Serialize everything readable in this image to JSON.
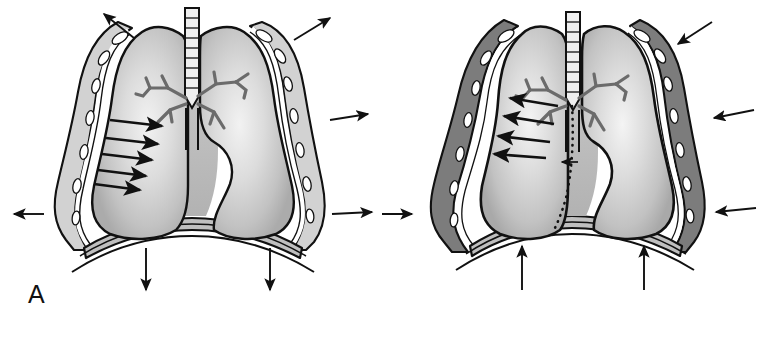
{
  "figure": {
    "style": "grayscale halftone medical line drawing",
    "colors": {
      "outline": "#111111",
      "lung_fill_light": "#e8e8e8",
      "lung_fill_mid": "#c9c9c9",
      "lung_fill_dark": "#b0b0b0",
      "chest_wall_fill": "#d0d0d0",
      "pleural_space_dark": "#7a7a7a",
      "rib_fill": "#ffffff",
      "background": "#ffffff",
      "arrow": "#111111",
      "bronchus": "#6b6b6b"
    }
  },
  "panels": [
    {
      "id": "A",
      "label": "A",
      "name": "panel-a-normal-recoil",
      "description": "Normal thorax: chest wall recoils outward, lungs recoil inward, diaphragm descends",
      "structures": [
        {
          "name": "trachea",
          "detail": "midline airway with cartilage rings"
        },
        {
          "name": "right-lung",
          "detail": "shaded lung field, left of midline in image"
        },
        {
          "name": "left-lung",
          "detail": "shaded lung field, right of midline in image"
        },
        {
          "name": "bronchial-tree",
          "detail": "branching main and lobar bronchi"
        },
        {
          "name": "chest-wall",
          "detail": "ribs shown as white oval cross-sections"
        },
        {
          "name": "diaphragm",
          "detail": "dome-shaped muscle at thorax base"
        },
        {
          "name": "pleural-layers",
          "detail": "thin visceral and parietal pleura, apposed"
        }
      ],
      "arrows": {
        "chest_wall_outward": {
          "count": 4,
          "direction": "outward",
          "meaning": "chest wall elastic recoil outward"
        },
        "lung_inward": {
          "count": 5,
          "direction": "inward",
          "meaning": "lung elastic recoil inward"
        },
        "diaphragm": {
          "count": 2,
          "direction": "down",
          "meaning": "diaphragm descends"
        }
      },
      "mediastinal_shift": false
    },
    {
      "id": "B",
      "label": "B",
      "name": "panel-b-collapse-pneumothorax",
      "description": "Pleural space filled: lung collapses inward, chest wall moves inward, diaphragm elevates, mediastinum shifts",
      "structures": [
        {
          "name": "trachea",
          "detail": "midline airway with cartilage rings"
        },
        {
          "name": "collapsed-right-lung",
          "detail": "lung retracted from chest wall"
        },
        {
          "name": "left-lung",
          "detail": "shaded lung field"
        },
        {
          "name": "bronchial-tree",
          "detail": "branching main and lobar bronchi"
        },
        {
          "name": "chest-wall",
          "detail": "ribs shown as white oval cross-sections"
        },
        {
          "name": "diaphragm",
          "detail": "elevated dome"
        },
        {
          "name": "pleural-space",
          "detail": "widened dark pleural space between lung and chest wall"
        },
        {
          "name": "mediastinal-shift-line",
          "detail": "dotted line marking original mediastinal position"
        }
      ],
      "arrows": {
        "chest_wall_inward": {
          "count": 4,
          "direction": "inward",
          "meaning": "chest wall moves inward"
        },
        "lung_outward": {
          "count": 4,
          "direction": "outward-left",
          "meaning": "lung collapse direction"
        },
        "diaphragm": {
          "count": 2,
          "direction": "up",
          "meaning": "diaphragm elevates"
        },
        "mediastinal": {
          "count": 1,
          "direction": "left",
          "meaning": "mediastinal shift"
        }
      },
      "mediastinal_shift": true
    }
  ]
}
